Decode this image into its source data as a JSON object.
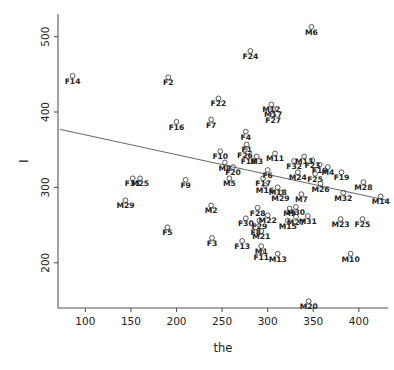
{
  "chart_data": {
    "type": "scatter",
    "title": "",
    "xlabel": "the",
    "ylabel": "I",
    "xlim": [
      70,
      432
    ],
    "ylim": [
      140,
      530
    ],
    "xticks": [
      100,
      150,
      200,
      250,
      300,
      350,
      400
    ],
    "yticks": [
      200,
      300,
      400,
      500
    ],
    "grid": false,
    "legend": null,
    "marker": "open-circle",
    "trendline": {
      "type": "linear",
      "x": [
        72,
        430
      ],
      "y": [
        377,
        283
      ]
    },
    "points": [
      {
        "label": "F14",
        "x": 86,
        "y": 448
      },
      {
        "label": "M6",
        "x": 348,
        "y": 513
      },
      {
        "label": "F24",
        "x": 281,
        "y": 481
      },
      {
        "label": "F2",
        "x": 191,
        "y": 446
      },
      {
        "label": "F22",
        "x": 246,
        "y": 418
      },
      {
        "label": "M12",
        "x": 304,
        "y": 410
      },
      {
        "label": "M17",
        "x": 306,
        "y": 404
      },
      {
        "label": "F27",
        "x": 306,
        "y": 396
      },
      {
        "label": "F16",
        "x": 200,
        "y": 387
      },
      {
        "label": "F7",
        "x": 238,
        "y": 390
      },
      {
        "label": "F4",
        "x": 276,
        "y": 374
      },
      {
        "label": "F1",
        "x": 277,
        "y": 357
      },
      {
        "label": "F26",
        "x": 275,
        "y": 350
      },
      {
        "label": "F10",
        "x": 248,
        "y": 348
      },
      {
        "label": "F18",
        "x": 279,
        "y": 341
      },
      {
        "label": "M3",
        "x": 288,
        "y": 341
      },
      {
        "label": "M11",
        "x": 308,
        "y": 345
      },
      {
        "label": "M8",
        "x": 253,
        "y": 333
      },
      {
        "label": "F20",
        "x": 262,
        "y": 327
      },
      {
        "label": "F32",
        "x": 329,
        "y": 335
      },
      {
        "label": "F23",
        "x": 349,
        "y": 336
      },
      {
        "label": "M13b",
        "x": 340,
        "y": 341
      },
      {
        "label": "F19",
        "x": 357,
        "y": 330
      },
      {
        "label": "M4",
        "x": 366,
        "y": 327
      },
      {
        "label": "F6",
        "x": 300,
        "y": 323
      },
      {
        "label": "M24",
        "x": 333,
        "y": 320
      },
      {
        "label": "F25b",
        "x": 352,
        "y": 318
      },
      {
        "label": "F19b",
        "x": 381,
        "y": 320
      },
      {
        "label": "M5",
        "x": 258,
        "y": 312
      },
      {
        "label": "F17",
        "x": 295,
        "y": 312
      },
      {
        "label": "F9",
        "x": 210,
        "y": 310
      },
      {
        "label": "F31",
        "x": 152,
        "y": 312
      },
      {
        "label": "M25",
        "x": 160,
        "y": 312
      },
      {
        "label": "M16",
        "x": 297,
        "y": 303
      },
      {
        "label": "M18",
        "x": 311,
        "y": 300
      },
      {
        "label": "M26",
        "x": 358,
        "y": 305
      },
      {
        "label": "M28",
        "x": 405,
        "y": 307
      },
      {
        "label": "M29b",
        "x": 314,
        "y": 293
      },
      {
        "label": "M7",
        "x": 337,
        "y": 291
      },
      {
        "label": "M32",
        "x": 383,
        "y": 293
      },
      {
        "label": "M14",
        "x": 424,
        "y": 288
      },
      {
        "label": "M29",
        "x": 144,
        "y": 283
      },
      {
        "label": "M2",
        "x": 238,
        "y": 276
      },
      {
        "label": "M30",
        "x": 331,
        "y": 274
      },
      {
        "label": "M9",
        "x": 324,
        "y": 272
      },
      {
        "label": "F28",
        "x": 289,
        "y": 273
      },
      {
        "label": "M22",
        "x": 300,
        "y": 263
      },
      {
        "label": "M31",
        "x": 344,
        "y": 262
      },
      {
        "label": "M27",
        "x": 331,
        "y": 261
      },
      {
        "label": "M15",
        "x": 322,
        "y": 256
      },
      {
        "label": "F30",
        "x": 276,
        "y": 259
      },
      {
        "label": "F29",
        "x": 291,
        "y": 256
      },
      {
        "label": "M23",
        "x": 380,
        "y": 258
      },
      {
        "label": "F25",
        "x": 404,
        "y": 258
      },
      {
        "label": "F5",
        "x": 190,
        "y": 247
      },
      {
        "label": "F8",
        "x": 287,
        "y": 247
      },
      {
        "label": "M21",
        "x": 293,
        "y": 242
      },
      {
        "label": "F3",
        "x": 239,
        "y": 233
      },
      {
        "label": "F13",
        "x": 272,
        "y": 229
      },
      {
        "label": "M1",
        "x": 293,
        "y": 222
      },
      {
        "label": "F11",
        "x": 293,
        "y": 214
      },
      {
        "label": "M13",
        "x": 311,
        "y": 212
      },
      {
        "label": "M10",
        "x": 391,
        "y": 212
      },
      {
        "label": "M20",
        "x": 345,
        "y": 149
      }
    ],
    "point_labels": [
      "F14",
      "M6",
      "F24",
      "F2",
      "F22",
      "M12",
      "M17",
      "F27",
      "F16",
      "F7",
      "F4",
      "F1",
      "F26",
      "F10",
      "F18",
      "M3",
      "M11",
      "M8",
      "F20",
      "F32",
      "F23",
      "F19",
      "M4",
      "F6",
      "M24",
      "M5",
      "F17",
      "F9",
      "F31",
      "M25",
      "M16",
      "M18",
      "M26",
      "M28",
      "M7",
      "M32",
      "M14",
      "M29",
      "M2",
      "M30",
      "M9",
      "F28",
      "M22",
      "M31",
      "M27",
      "M15",
      "F30",
      "F29",
      "M23",
      "F25",
      "F5",
      "F8",
      "M21",
      "F3",
      "F13",
      "M1",
      "F11",
      "M13",
      "M10",
      "M20"
    ]
  },
  "style": {
    "marker_stroke": "#444444",
    "axis_color": "#555555",
    "trend_color": "#666666",
    "label_color": "#222222",
    "background": "#ffffff"
  }
}
